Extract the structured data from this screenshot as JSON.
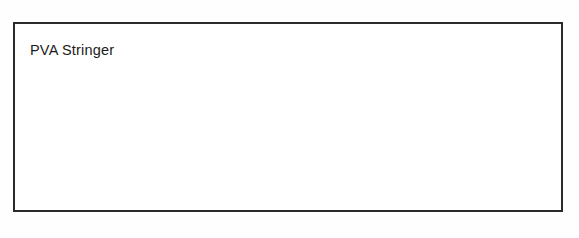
{
  "figure": {
    "caption": "PVA Stringer",
    "frame": {
      "border_color": "#2b2b2b",
      "background_color": "#ffffff",
      "x": 13,
      "y": 22,
      "width": 550,
      "height": 190
    },
    "page_background_color": "#fefefe",
    "ink_color": "#3a3a3a",
    "stipple_color": "#6b6b6b"
  },
  "diagram": {
    "type": "line-drawing",
    "elements": [
      {
        "name": "mainline",
        "label": "mainline",
        "description": "faint horizontal line entering from left frame edge to the hook eye",
        "x1": 16,
        "y1": 153,
        "x2": 133,
        "y2": 152
      },
      {
        "name": "hook",
        "label": "hook",
        "description": "fishing hook with eye at left, straight shank, curved bend and barbed point",
        "eye_x": 134,
        "eye_y": 152,
        "shank_end_x": 176,
        "shank_end_y": 152,
        "bend_bottom_x": 158,
        "bend_bottom_y": 180,
        "point_x": 142,
        "point_y": 168
      },
      {
        "name": "hook-knot",
        "label": "knot",
        "description": "PVA string knotted to the hook shank with two tag ends hanging down",
        "x": 180,
        "y": 155
      },
      {
        "name": "hanging-boilie",
        "label": "boilie",
        "description": "single stippled bait ball suspended above the stringer on a fine thread",
        "cx": 189,
        "cy": 107,
        "r": 21
      },
      {
        "name": "hanging-boilie-thread",
        "label": "thread",
        "description": "fine line linking the hanging boilie down to the hook knot",
        "x1": 170,
        "y1": 118,
        "x2": 138,
        "y2": 145
      },
      {
        "name": "pva-string",
        "label": "PVA string",
        "description": "twisted PVA string running horizontally through all five boilies",
        "x1": 180,
        "y1": 154,
        "x2": 500,
        "y2": 150
      },
      {
        "name": "end-knot",
        "label": "knot",
        "description": "PVA string knotted at the right end beyond the last boilie with tag ends",
        "x": 480,
        "y": 152
      }
    ],
    "boilies": [
      {
        "name": "boilie-1",
        "cx": 189,
        "cy": 107,
        "r": 21,
        "position": "hanging"
      },
      {
        "name": "boilie-2",
        "cx": 261,
        "cy": 151,
        "r": 18,
        "position": "on-string"
      },
      {
        "name": "boilie-3",
        "cx": 331,
        "cy": 150,
        "r": 18,
        "position": "on-string"
      },
      {
        "name": "boilie-4",
        "cx": 399,
        "cy": 153,
        "r": 18,
        "position": "on-string"
      },
      {
        "name": "boilie-5",
        "cx": 458,
        "cy": 155,
        "r": 18,
        "position": "on-string"
      }
    ],
    "boilie_count_on_string": 4,
    "boilie_count_total": 5
  }
}
